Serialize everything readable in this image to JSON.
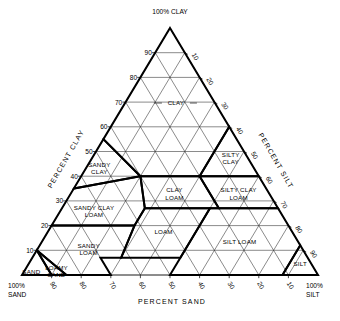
{
  "chart_data": {
    "type": "diagram",
    "subtype": "ternary-classification",
    "axes": {
      "left": {
        "label": "PERCENT CLAY",
        "ticks": [
          10,
          20,
          30,
          40,
          50,
          60,
          70,
          80,
          90
        ],
        "range": [
          0,
          100
        ],
        "direction": "bottom-to-top"
      },
      "right": {
        "label": "PERCENT SILT",
        "ticks": [
          10,
          20,
          30,
          40,
          50,
          60,
          70,
          80,
          90
        ],
        "range": [
          0,
          100
        ],
        "direction": "top-to-bottom"
      },
      "bottom": {
        "label": "PERCENT SAND",
        "ticks": [
          90,
          80,
          70,
          60,
          50,
          40,
          30,
          20,
          10
        ],
        "range": [
          0,
          100
        ],
        "direction": "left-to-right-decreasing"
      }
    },
    "corners": {
      "top": "100% CLAY",
      "bottom_left_line1": "100%",
      "bottom_left_line2": "SAND",
      "bottom_right_line1": "100%",
      "bottom_right_line2": "SILT"
    },
    "grid_interval": 10,
    "grid": true,
    "classes": [
      {
        "name": "CLAY",
        "label_lines": [
          "CLAY"
        ],
        "vertices_clay_silt_sand": [
          [
            100,
            0,
            0
          ],
          [
            60,
            40,
            0
          ],
          [
            40,
            40,
            20
          ],
          [
            40,
            20,
            40
          ],
          [
            55,
            0,
            45
          ]
        ]
      },
      {
        "name": "SILTY CLAY",
        "label_lines": [
          "SILTY",
          "CLAY"
        ],
        "vertices_clay_silt_sand": [
          [
            60,
            40,
            0
          ],
          [
            40,
            60,
            0
          ],
          [
            40,
            40,
            20
          ]
        ]
      },
      {
        "name": "SANDY CLAY",
        "label_lines": [
          "SANDY",
          "CLAY"
        ],
        "vertices_clay_silt_sand": [
          [
            55,
            0,
            45
          ],
          [
            40,
            20,
            40
          ],
          [
            35,
            0,
            65
          ]
        ]
      },
      {
        "name": "SILTY CLAY LOAM",
        "label_lines": [
          "SILTY CLAY",
          "LOAM"
        ],
        "vertices_clay_silt_sand": [
          [
            40,
            60,
            0
          ],
          [
            27,
            73,
            0
          ],
          [
            27,
            53,
            20
          ],
          [
            40,
            40,
            20
          ]
        ]
      },
      {
        "name": "CLAY LOAM",
        "label_lines": [
          "CLAY",
          "LOAM"
        ],
        "vertices_clay_silt_sand": [
          [
            40,
            40,
            20
          ],
          [
            27,
            53,
            20
          ],
          [
            27,
            28,
            45
          ],
          [
            40,
            20,
            40
          ]
        ]
      },
      {
        "name": "SANDY CLAY LOAM",
        "label_lines": [
          "SANDY CLAY",
          "LOAM"
        ],
        "vertices_clay_silt_sand": [
          [
            35,
            0,
            65
          ],
          [
            40,
            20,
            40
          ],
          [
            27,
            28,
            45
          ],
          [
            20,
            28,
            52
          ],
          [
            20,
            0,
            80
          ]
        ]
      },
      {
        "name": "LOAM",
        "label_lines": [
          "LOAM"
        ],
        "vertices_clay_silt_sand": [
          [
            27,
            28,
            45
          ],
          [
            27,
            50,
            23
          ],
          [
            7,
            50,
            43
          ],
          [
            7,
            30,
            63
          ],
          [
            20,
            28,
            52
          ]
        ]
      },
      {
        "name": "SILT LOAM",
        "label_lines": [
          "SILT",
          "LOAM"
        ],
        "vertices_clay_silt_sand": [
          [
            27,
            73,
            0
          ],
          [
            12,
            88,
            0
          ],
          [
            0,
            88,
            12
          ],
          [
            0,
            50,
            50
          ],
          [
            7,
            50,
            43
          ],
          [
            27,
            50,
            23
          ]
        ]
      },
      {
        "name": "SILT",
        "label_lines": [
          "SILT"
        ],
        "vertices_clay_silt_sand": [
          [
            12,
            88,
            0
          ],
          [
            0,
            100,
            0
          ],
          [
            0,
            88,
            12
          ]
        ]
      },
      {
        "name": "SANDY LOAM",
        "label_lines": [
          "SANDY",
          "LOAM"
        ],
        "vertices_clay_silt_sand": [
          [
            20,
            0,
            80
          ],
          [
            20,
            28,
            52
          ],
          [
            7,
            30,
            63
          ],
          [
            7,
            23,
            70
          ],
          [
            0,
            30,
            70
          ],
          [
            0,
            15,
            85
          ],
          [
            10,
            0,
            90
          ]
        ]
      },
      {
        "name": "LOAMY SAND",
        "label_lines": [
          "LOAMY",
          "SAND"
        ],
        "vertices_clay_silt_sand": [
          [
            10,
            0,
            90
          ],
          [
            0,
            15,
            85
          ],
          [
            0,
            10,
            90
          ]
        ]
      },
      {
        "name": "SAND",
        "label_lines": [
          "SAND"
        ],
        "vertices_clay_silt_sand": [
          [
            10,
            0,
            90
          ],
          [
            0,
            10,
            90
          ],
          [
            0,
            0,
            100
          ]
        ]
      }
    ],
    "class_labels": [
      {
        "name": "clay",
        "text": "CLAY",
        "line2": ""
      },
      {
        "name": "silty-clay",
        "text": "SILTY",
        "line2": "CLAY"
      },
      {
        "name": "sandy-clay",
        "text": "SANDY",
        "line2": "CLAY"
      },
      {
        "name": "silty-clay-loam",
        "text": "SILTY CLAY",
        "line2": "LOAM"
      },
      {
        "name": "clay-loam",
        "text": "CLAY",
        "line2": "LOAM"
      },
      {
        "name": "sandy-clay-loam",
        "text": "SANDY CLAY",
        "line2": "LOAM"
      },
      {
        "name": "loam",
        "text": "LOAM",
        "line2": ""
      },
      {
        "name": "silt-loam",
        "text": "SILT  LOAM",
        "line2": ""
      },
      {
        "name": "silt",
        "text": "SILT",
        "line2": ""
      },
      {
        "name": "sandy-loam",
        "text": "SANDY",
        "line2": "LOAM"
      },
      {
        "name": "loamy-sand",
        "text": "LOAMY",
        "line2": "SAND"
      },
      {
        "name": "sand",
        "text": "SAND",
        "line2": ""
      }
    ]
  },
  "labels": {
    "apex": "100% CLAY",
    "bottom_left_1": "100%",
    "bottom_left_2": "SAND",
    "bottom_right_1": "100%",
    "bottom_right_2": "SILT",
    "axis_left": "PERCENT CLAY",
    "axis_right": "PERCENT SILT",
    "axis_bottom": "PERCENT SAND",
    "class_clay": "CLAY",
    "class_silty_clay_1": "SILTY",
    "class_silty_clay_2": "CLAY",
    "class_sandy_clay_1": "SANDY",
    "class_sandy_clay_2": "CLAY",
    "class_silty_clay_loam_1": "SILTY CLAY",
    "class_silty_clay_loam_2": "LOAM",
    "class_clay_loam_1": "CLAY",
    "class_clay_loam_2": "LOAM",
    "class_sandy_clay_loam_1": "SANDY CLAY",
    "class_sandy_clay_loam_2": "LOAM",
    "class_loam": "LOAM",
    "class_silt_loam": "SILT  LOAM",
    "class_silt": "SILT",
    "class_sandy_loam_1": "SANDY",
    "class_sandy_loam_2": "LOAM",
    "class_loamy_sand_1": "LOAMY",
    "class_loamy_sand_2": "SAND",
    "class_sand": "SAND"
  },
  "ticks": {
    "left": [
      "90",
      "80",
      "70",
      "60",
      "50",
      "40",
      "30",
      "20",
      "10"
    ],
    "right": [
      "10",
      "20",
      "30",
      "40",
      "50",
      "60",
      "70",
      "80",
      "90"
    ],
    "bottom": [
      "90",
      "80",
      "70",
      "60",
      "50",
      "40",
      "30",
      "20",
      "10"
    ]
  }
}
